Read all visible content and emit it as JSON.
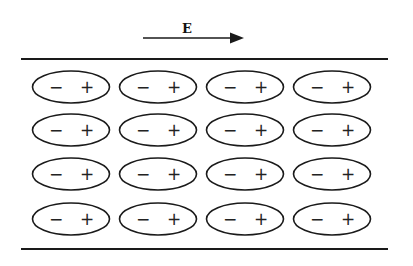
{
  "diagram": {
    "field": {
      "label": "E",
      "direction": "right"
    },
    "plates": [
      "top-plate",
      "bottom-plate"
    ],
    "dipoles": {
      "rows": 4,
      "columns": 4,
      "negative_symbol": "−",
      "positive_symbol": "+",
      "orientation": "negative-left-positive-right"
    },
    "colors": {
      "stroke": "#1a1a1a",
      "background": "#ffffff"
    }
  }
}
